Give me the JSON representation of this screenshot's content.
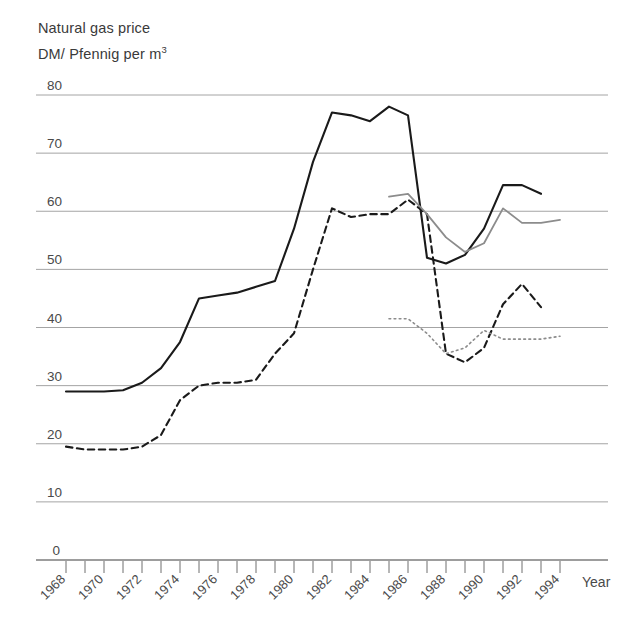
{
  "title": {
    "line1": "Natural gas price",
    "line2_prefix": "DM/ Pfennig per m",
    "line2_sup": "3"
  },
  "axis": {
    "x_name": "Year",
    "y_ticks": [
      "80",
      "70",
      "60",
      "50",
      "40",
      "30",
      "20",
      "10",
      "0"
    ],
    "x_ticks": [
      "1968",
      "1970",
      "1972",
      "1974",
      "1976",
      "1978",
      "1980",
      "1982",
      "1984",
      "1986",
      "1988",
      "1990",
      "1992",
      "1994"
    ]
  },
  "chart_data": {
    "type": "line",
    "title": "Natural gas price",
    "subtitle": "DM/ Pfennig per m3",
    "xlabel": "Year",
    "ylabel": "DM/ Pfennig per m3",
    "xlim": [
      1968,
      1995
    ],
    "ylim": [
      0,
      80
    ],
    "grid": true,
    "legend": "none",
    "x": [
      1968,
      1969,
      1970,
      1971,
      1972,
      1973,
      1974,
      1975,
      1976,
      1977,
      1978,
      1979,
      1980,
      1981,
      1982,
      1983,
      1984,
      1985,
      1986,
      1987,
      1988,
      1989,
      1990,
      1991,
      1992,
      1993,
      1994
    ],
    "series": [
      {
        "name": "series-solid-black",
        "style": "solid",
        "color": "#1a1a1a",
        "width": 2.1,
        "x": [
          1968,
          1969,
          1970,
          1971,
          1972,
          1973,
          1974,
          1975,
          1976,
          1977,
          1978,
          1979,
          1980,
          1981,
          1982,
          1983,
          1984,
          1985,
          1986,
          1987,
          1988,
          1989,
          1990,
          1991,
          1992,
          1993
        ],
        "values": [
          29.0,
          29.0,
          29.0,
          29.2,
          30.5,
          33.0,
          37.5,
          45.0,
          45.5,
          46.0,
          47.0,
          48.0,
          57.0,
          68.5,
          77.0,
          76.5,
          75.5,
          78.0,
          76.5,
          52.0,
          51.0,
          52.5,
          57.0,
          64.5,
          64.5,
          63.0
        ]
      },
      {
        "name": "series-dashed-black",
        "style": "dashed",
        "color": "#1a1a1a",
        "width": 2.1,
        "x": [
          1968,
          1969,
          1970,
          1971,
          1972,
          1973,
          1974,
          1975,
          1976,
          1977,
          1978,
          1979,
          1980,
          1981,
          1982,
          1983,
          1984,
          1985,
          1986,
          1987,
          1988,
          1989,
          1990,
          1991,
          1992,
          1993
        ],
        "values": [
          19.5,
          19.0,
          19.0,
          19.0,
          19.5,
          21.5,
          27.5,
          30.0,
          30.5,
          30.5,
          31.0,
          35.5,
          39.0,
          50.0,
          60.5,
          59.0,
          59.5,
          59.5,
          62.0,
          59.5,
          35.5,
          34.0,
          36.5,
          44.0,
          47.5,
          43.5
        ]
      },
      {
        "name": "series-solid-gray",
        "style": "solid",
        "color": "#8c8c8c",
        "width": 1.8,
        "x": [
          1985,
          1986,
          1987,
          1988,
          1989,
          1990,
          1991,
          1992,
          1993,
          1994
        ],
        "values": [
          62.5,
          63.0,
          59.5,
          55.5,
          53.0,
          54.5,
          60.5,
          58.0,
          58.0,
          58.5
        ]
      },
      {
        "name": "series-dotted-gray",
        "style": "dotted",
        "color": "#8c8c8c",
        "width": 1.6,
        "x": [
          1985,
          1986,
          1987,
          1988,
          1989,
          1990,
          1991,
          1992,
          1993,
          1994
        ],
        "values": [
          41.5,
          41.5,
          39.0,
          35.5,
          36.5,
          39.5,
          38.0,
          38.0,
          38.0,
          38.5
        ]
      }
    ]
  },
  "colors": {
    "grid": "#9a9a9a",
    "axis": "#6e6e6e",
    "ink_dark": "#1a1a1a",
    "ink_gray": "#8c8c8c",
    "text": "#3b3b3b"
  }
}
